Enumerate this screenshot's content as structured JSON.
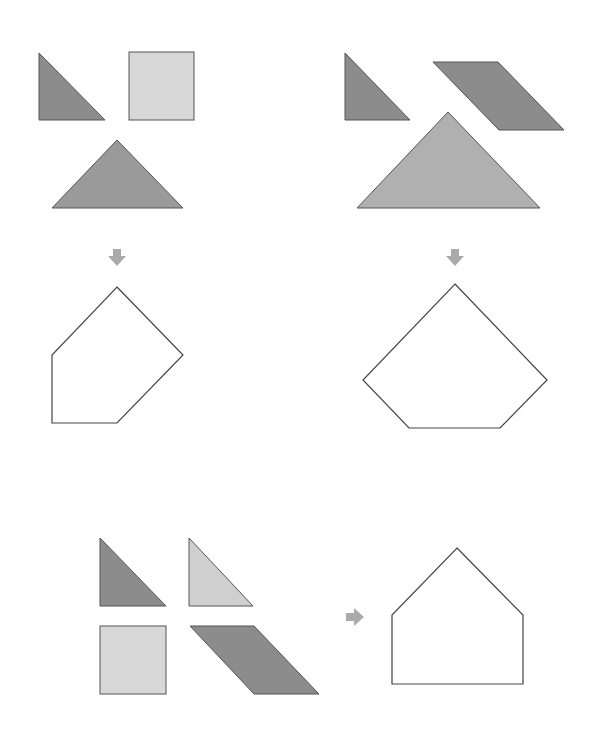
{
  "colors": {
    "dark": "#8c8c8c",
    "medium": "#9a9a9a",
    "light": "#d8d8d8",
    "lighter_big": "#b0b0b0",
    "arrow": "#aaaaaa",
    "outline": "#444444"
  },
  "groups": [
    {
      "name": "top-left",
      "pieces": [
        "small-triangle-dark",
        "square-light",
        "large-triangle"
      ],
      "result": "pentagon-left"
    },
    {
      "name": "top-right",
      "pieces": [
        "small-triangle-dark",
        "parallelogram",
        "large-triangle"
      ],
      "result": "pentagon-right"
    },
    {
      "name": "bottom",
      "pieces": [
        "small-triangle-dark",
        "small-triangle-light",
        "square-light",
        "parallelogram"
      ],
      "result": "house-pentagon"
    }
  ],
  "icons": {
    "down_arrow": "down-arrow-icon",
    "right_arrow": "right-arrow-icon"
  }
}
